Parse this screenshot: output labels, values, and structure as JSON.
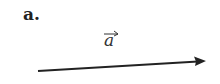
{
  "panel": {
    "label": "a.",
    "vector_symbol": "a",
    "vector_has_overarrow": true
  },
  "arrow": {
    "start": [
      38,
      71
    ],
    "end": [
      205,
      61
    ],
    "color": "#222222"
  }
}
